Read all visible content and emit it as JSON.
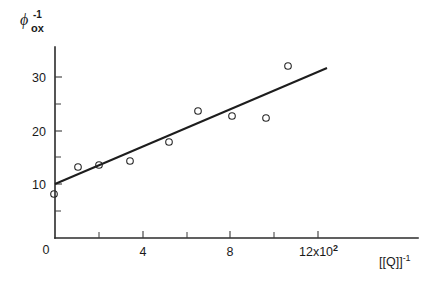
{
  "figure": {
    "background_color": "#ffffff",
    "ink_color": "#1a1a1a"
  },
  "chart_data": {
    "type": "scatter",
    "title": "",
    "subtitle": "",
    "xlabel": "[Q]",
    "xlabel_sup": "-1",
    "ylabel": "ϕ",
    "ylabel_sup": "-1",
    "ylabel_sub": "ox",
    "x_multiplier_text": "12x10",
    "x_multiplier_exponent": "2",
    "xlim": [
      0,
      13.0
    ],
    "ylim": [
      0,
      34.5
    ],
    "grid": false,
    "legend": null,
    "x_ticks_major": [
      0,
      4,
      8,
      12
    ],
    "x_ticks_major_labels": [
      "0",
      "4",
      "8",
      "12x10"
    ],
    "x_ticks_minor": [
      2,
      6,
      10
    ],
    "y_ticks_major": [
      10,
      20,
      30
    ],
    "y_ticks_major_labels": [
      "10",
      "20",
      "30"
    ],
    "y_ticks_minor": [
      5,
      15,
      25
    ],
    "marker": "open-circle",
    "points": [
      {
        "x": 0.0,
        "y": 9.9
      },
      {
        "x": 1.05,
        "y": 14.3
      },
      {
        "x": 2.0,
        "y": 14.7
      },
      {
        "x": 3.4,
        "y": 15.4
      },
      {
        "x": 5.2,
        "y": 19.0
      },
      {
        "x": 6.5,
        "y": 24.8
      },
      {
        "x": 8.1,
        "y": 23.8
      },
      {
        "x": 9.6,
        "y": 23.3
      },
      {
        "x": 10.6,
        "y": 32.6
      }
    ],
    "fit_line": {
      "name": "linear regression",
      "x_start": 0.0,
      "y_start": 10.1,
      "x_end": 12.0,
      "y_end": 31.7,
      "slope": 1.8,
      "intercept": 10.1
    }
  }
}
